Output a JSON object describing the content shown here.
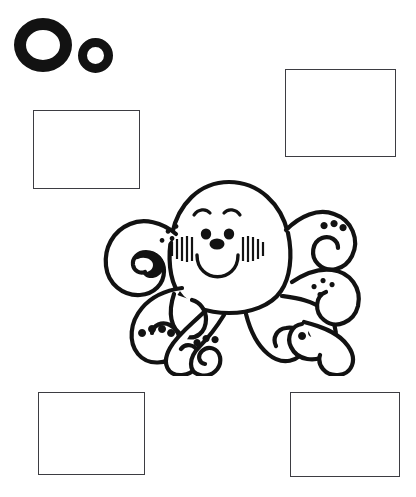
{
  "page": {
    "kind": "letter-worksheet",
    "background_color": "#ffffff",
    "ink_color": "#121212",
    "box_border_color": "#3d3d42",
    "header_text": "· · · ·"
  },
  "letter": {
    "uppercase": "O",
    "lowercase": "o",
    "pair_label": "Oo",
    "stroke_color": "#121212"
  },
  "illustration": {
    "subject": "octopus",
    "style": "black-and-white line art coloring page",
    "description": "Smiling cartoon octopus with a large rounded head, curved eyebrows, two dot eyes, a rounded snout, hatched blush lines on both cheeks, an open U-shaped smile, and eight curling tentacles with suction-cup dots.",
    "fill_color": "#ffffff",
    "outline_color": "#121212",
    "face": {
      "eyes": 2,
      "eyebrows": 2,
      "cheeks": 2,
      "smile": "u-shaped",
      "nose": "rounded"
    },
    "tentacles": 8
  },
  "boxes": [
    {
      "id": "box-top-left",
      "label": "Answer box 1",
      "value": ""
    },
    {
      "id": "box-top-right",
      "label": "Answer box 2",
      "value": ""
    },
    {
      "id": "box-bottom-left",
      "label": "Answer box 3",
      "value": ""
    },
    {
      "id": "box-bottom-right",
      "label": "Answer box 4",
      "value": ""
    }
  ]
}
